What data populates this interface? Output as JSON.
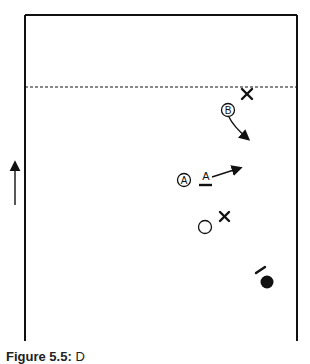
{
  "figure": {
    "caption_label": "Figure 5.5:",
    "caption_text": "D",
    "colors": {
      "ink": "#111111",
      "background": "#ffffff"
    }
  },
  "field": {
    "left_x": 25,
    "right_x": 297,
    "top_y": 15,
    "bottom_y": 340,
    "dashed_line_y": 87
  },
  "markers": {
    "defender_x_top": {
      "symbol": "X",
      "x": 247,
      "y": 94
    },
    "player_b": {
      "label": "B",
      "x": 228,
      "y": 110
    },
    "player_a": {
      "label": "A",
      "x": 184,
      "y": 180
    },
    "position_a": {
      "label": "A",
      "x": 206,
      "y": 178
    },
    "open_circle": {
      "x": 205,
      "y": 228
    },
    "defender_x_mid": {
      "symbol": "X",
      "x": 225,
      "y": 217
    },
    "ball": {
      "x": 267,
      "y": 283
    }
  },
  "direction_arrow": {
    "label": "direction of play",
    "x": 15,
    "y_from": 205,
    "y_to": 160
  }
}
